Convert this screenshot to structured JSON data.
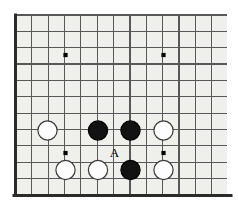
{
  "figure": {
    "background_color": "#ffffff"
  },
  "board": {
    "board_fill": "#efefec",
    "grid_line_color": "#58585a",
    "grid_line_width": 1.15,
    "edge_line_color": "#2b2b2b",
    "edge_line_width": 3.0,
    "star_point_color": "#000000",
    "star_point_radius": 2.1,
    "geometry": {
      "origin_x": 15.5,
      "origin_y": 15.0,
      "spacing": 16.35,
      "cols": 13,
      "rows": 11,
      "left_edge_x": 15.5,
      "bottom_edge_y": 195.5,
      "clip_right_x": 227.0,
      "clip_top_y": 15.0
    },
    "edges": [
      {
        "name": "left-edge",
        "type": "vertical"
      },
      {
        "name": "bottom-edge",
        "type": "horizontal"
      }
    ],
    "star_points": [
      {
        "name": "star-point-upper-left",
        "col": 3,
        "row": 2,
        "x": 65.5,
        "y": 55.0
      },
      {
        "name": "star-point-upper-right",
        "col": 9,
        "row": 2,
        "x": 163.5,
        "y": 55.0
      },
      {
        "name": "star-point-lower-left",
        "col": 3,
        "row": 8,
        "x": 65.5,
        "y": 153.0
      },
      {
        "name": "star-point-lower-right",
        "col": 9,
        "row": 8,
        "x": 163.5,
        "y": 153.0
      }
    ]
  },
  "stones": {
    "radius": 9.6,
    "black_fill": "#121212",
    "black_stroke": "#000000",
    "white_fill": "#fdfdfd",
    "white_stroke": "#3a3a3a",
    "stroke_width": 1.2,
    "items": [
      {
        "name": "white-stone-1",
        "color": "white",
        "col": 2,
        "row": 7,
        "x": 47.5,
        "y": 130.5
      },
      {
        "name": "black-stone-1",
        "color": "black",
        "col": 5,
        "row": 7,
        "x": 98.0,
        "y": 130.5
      },
      {
        "name": "black-stone-2",
        "color": "black",
        "col": 7,
        "row": 7,
        "x": 130.5,
        "y": 130.5
      },
      {
        "name": "white-stone-2",
        "color": "white",
        "col": 9,
        "row": 7,
        "x": 163.5,
        "y": 130.5
      },
      {
        "name": "white-stone-3",
        "color": "white",
        "col": 3,
        "row": 9,
        "x": 65.5,
        "y": 170.0
      },
      {
        "name": "white-stone-4",
        "color": "white",
        "col": 5,
        "row": 9,
        "x": 98.0,
        "y": 170.0
      },
      {
        "name": "black-stone-3",
        "color": "black",
        "col": 7,
        "row": 9,
        "x": 130.5,
        "y": 170.0
      },
      {
        "name": "white-stone-5",
        "color": "white",
        "col": 9,
        "row": 9,
        "x": 163.5,
        "y": 170.0
      }
    ]
  },
  "labels": [
    {
      "name": "point-label-a",
      "text": "A",
      "x": 114.5,
      "y": 151.5,
      "color": "#000000",
      "describes": "empty intersection between the two black stones"
    }
  ]
}
